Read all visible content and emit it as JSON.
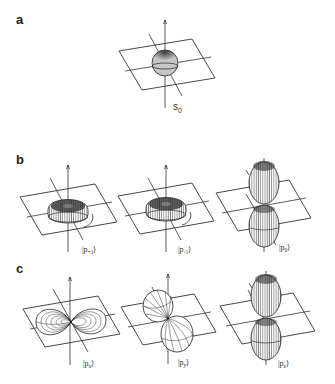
{
  "figure": {
    "panels": [
      {
        "id": "a",
        "label": "a",
        "orbitals": [
          {
            "name": "s-orbital",
            "shape": "sphere",
            "ket": "s",
            "subscript": "0",
            "label_style": "plain"
          }
        ]
      },
      {
        "id": "b",
        "label": "b",
        "orbitals": [
          {
            "name": "p-plus-1",
            "shape": "torus",
            "ket": "p",
            "subscript": "+1",
            "label_style": "ket"
          },
          {
            "name": "p-minus-1",
            "shape": "torus",
            "ket": "p",
            "subscript": "-1",
            "label_style": "ket"
          },
          {
            "name": "p-0",
            "shape": "dumbbell-vertical",
            "ket": "p",
            "subscript": "0",
            "label_style": "ket"
          }
        ]
      },
      {
        "id": "c",
        "label": "c",
        "orbitals": [
          {
            "name": "p-x",
            "shape": "dumbbell-horizontal-x",
            "ket": "p",
            "subscript": "x",
            "label_style": "ket"
          },
          {
            "name": "p-y",
            "shape": "dumbbell-diagonal-y",
            "ket": "p",
            "subscript": "y",
            "label_style": "ket"
          },
          {
            "name": "p-z",
            "shape": "dumbbell-vertical",
            "ket": "p",
            "subscript": "z",
            "label_style": "ket"
          }
        ]
      }
    ],
    "labels": {
      "a": "a",
      "b": "b",
      "c": "c",
      "s0_main": "s",
      "s0_sub": "0",
      "ket_open": "|",
      "ket_close": "⟩",
      "p": "p",
      "b1_sub": "+1",
      "b2_sub": "-1",
      "b3_sub": "0",
      "c1_sub": "x",
      "c2_sub": "y",
      "c3_sub": "z"
    },
    "colors": {
      "ink": "#222222",
      "background": "#ffffff"
    }
  }
}
